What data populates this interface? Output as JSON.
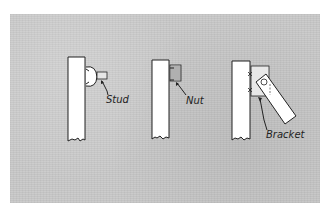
{
  "diagram": {
    "title": "",
    "background_color": "#c9c9c9",
    "line_color": "#222222",
    "figures": [
      {
        "id": "stud",
        "label": "Stud"
      },
      {
        "id": "nut",
        "label": "Nut"
      },
      {
        "id": "bracket",
        "label": "Bracket"
      }
    ]
  }
}
